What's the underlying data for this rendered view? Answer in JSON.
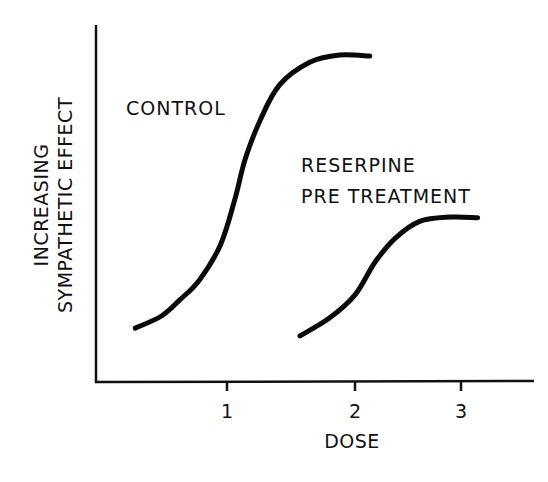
{
  "chart_data": {
    "type": "line",
    "title": "",
    "xlabel": "DOSE",
    "ylabel_lines": [
      "INCREASING",
      "SYMPATHETIC EFFECT"
    ],
    "xticks": [
      {
        "value": 1,
        "label": "1"
      },
      {
        "value": 2,
        "label": "2"
      },
      {
        "value": 3,
        "label": "3"
      }
    ],
    "xlim": [
      0,
      3.7
    ],
    "ylim": [
      0,
      100
    ],
    "yticks": [],
    "grid": false,
    "legend": "none (inline annotations)",
    "series": [
      {
        "name": "CONTROL",
        "label_lines": [
          "CONTROL"
        ],
        "color": "#0a0a0a",
        "x": [
          0.3,
          0.5,
          0.64,
          0.79,
          0.95,
          1.06,
          1.14,
          1.26,
          1.41,
          1.65,
          1.88,
          2.14
        ],
        "y": [
          15.1,
          18.5,
          23.0,
          28.6,
          38.4,
          51.0,
          62.2,
          73.4,
          83.2,
          89.6,
          91.6,
          91.3
        ]
      },
      {
        "name": "RESERPINE PRE TREATMENT",
        "label_lines": [
          "RESERPINE",
          "PRE TREATMENT"
        ],
        "color": "#0a0a0a",
        "x": [
          1.57,
          1.8,
          2.0,
          2.19,
          2.38,
          2.61,
          2.9,
          3.16
        ],
        "y": [
          12.9,
          17.9,
          24.4,
          33.6,
          40.3,
          45.0,
          46.2,
          46.0
        ]
      }
    ]
  }
}
